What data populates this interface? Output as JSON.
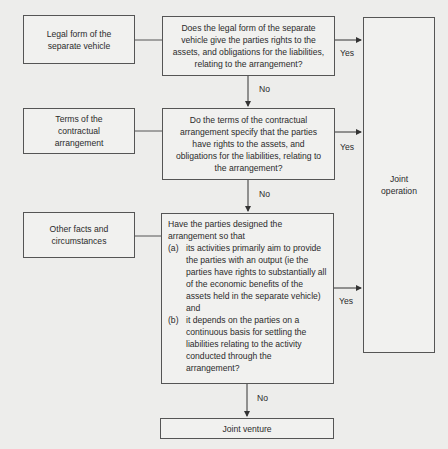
{
  "diagram": {
    "type": "flowchart",
    "factors": [
      {
        "id": "legal-form",
        "label": "Legal form of the separate vehicle"
      },
      {
        "id": "contract-terms",
        "label": "Terms of the contractual arrangement"
      },
      {
        "id": "other-facts",
        "label": "Other facts and circumstances"
      }
    ],
    "questions": [
      {
        "id": "q1",
        "text": "Does the legal form of the separate vehicle give the parties rights to the assets, and obligations for the liabilities, relating to the arrangement?"
      },
      {
        "id": "q2",
        "text": "Do the terms of the contractual arrangement specify that the parties have rights to the assets, and obligations for the liabilities, relating to the arrangement?"
      },
      {
        "id": "q3",
        "intro": "Have the parties designed the arrangement so that",
        "items": [
          {
            "mark": "(a)",
            "text": "its activities primarily aim to provide the parties with an output (ie the parties have rights to substantially all of the economic benefits of the assets held in the separate vehicle) and"
          },
          {
            "mark": "(b)",
            "text": "it depends on the parties on a continuous basis for settling the liabilities relating to the activity conducted through the arrangement?"
          }
        ]
      }
    ],
    "outcomes": {
      "yes_result": "Joint operation",
      "no_result": "Joint venture"
    },
    "edge_labels": {
      "yes": "Yes",
      "no": "No"
    },
    "colors": {
      "background": "#ededeb",
      "box_fill": "#f1f1ef",
      "stroke": "#555555",
      "text": "#2b2b2b"
    }
  }
}
